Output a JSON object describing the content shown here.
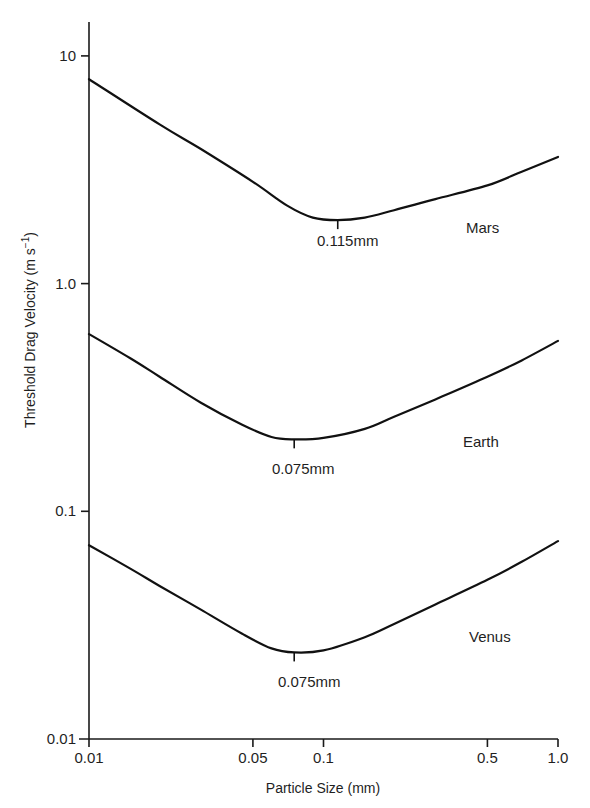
{
  "chart_data": {
    "type": "line",
    "title": "",
    "xlabel": "Particle Size (mm)",
    "ylabel": "Threshold Drag Velocity (m s⁻¹)",
    "ylabel_parts": {
      "main": "Threshold Drag Velocity (m s",
      "sup": "−1",
      "close": ")"
    },
    "xscale": "log",
    "yscale": "log",
    "xlim": [
      0.01,
      1.0
    ],
    "ylim": [
      0.01,
      10
    ],
    "grid": false,
    "legend": "inline labels at right of each curve",
    "x_ticks": [
      {
        "value": 0.01,
        "label": "0.01"
      },
      {
        "value": 0.05,
        "label": "0.05"
      },
      {
        "value": 0.1,
        "label": "0.1"
      },
      {
        "value": 0.5,
        "label": "0.5"
      },
      {
        "value": 1.0,
        "label": "1.0"
      }
    ],
    "y_ticks": [
      {
        "value": 10,
        "label": "10"
      },
      {
        "value": 1.0,
        "label": "1.0"
      },
      {
        "value": 0.1,
        "label": "0.1"
      },
      {
        "value": 0.01,
        "label": "0.01"
      }
    ],
    "series": [
      {
        "name": "Mars",
        "minimum": {
          "x": 0.115,
          "y": 1.9,
          "label": "0.115mm"
        },
        "points": [
          {
            "x": 0.01,
            "y": 7.9
          },
          {
            "x": 0.02,
            "y": 5.0
          },
          {
            "x": 0.03,
            "y": 3.9
          },
          {
            "x": 0.05,
            "y": 2.8
          },
          {
            "x": 0.07,
            "y": 2.2
          },
          {
            "x": 0.09,
            "y": 1.95
          },
          {
            "x": 0.115,
            "y": 1.9
          },
          {
            "x": 0.15,
            "y": 1.95
          },
          {
            "x": 0.2,
            "y": 2.1
          },
          {
            "x": 0.3,
            "y": 2.35
          },
          {
            "x": 0.5,
            "y": 2.7
          },
          {
            "x": 0.7,
            "y": 3.1
          },
          {
            "x": 1.0,
            "y": 3.6
          }
        ]
      },
      {
        "name": "Earth",
        "minimum": {
          "x": 0.075,
          "y": 0.207,
          "label": "0.075mm"
        },
        "points": [
          {
            "x": 0.01,
            "y": 0.6
          },
          {
            "x": 0.015,
            "y": 0.47
          },
          {
            "x": 0.02,
            "y": 0.39
          },
          {
            "x": 0.03,
            "y": 0.3
          },
          {
            "x": 0.045,
            "y": 0.24
          },
          {
            "x": 0.06,
            "y": 0.212
          },
          {
            "x": 0.075,
            "y": 0.207
          },
          {
            "x": 0.1,
            "y": 0.21
          },
          {
            "x": 0.15,
            "y": 0.23
          },
          {
            "x": 0.2,
            "y": 0.26
          },
          {
            "x": 0.3,
            "y": 0.31
          },
          {
            "x": 0.5,
            "y": 0.39
          },
          {
            "x": 0.7,
            "y": 0.46
          },
          {
            "x": 1.0,
            "y": 0.56
          }
        ]
      },
      {
        "name": "Venus",
        "minimum": {
          "x": 0.075,
          "y": 0.024,
          "label": "0.075mm"
        },
        "points": [
          {
            "x": 0.01,
            "y": 0.071
          },
          {
            "x": 0.015,
            "y": 0.056
          },
          {
            "x": 0.02,
            "y": 0.047
          },
          {
            "x": 0.03,
            "y": 0.037
          },
          {
            "x": 0.045,
            "y": 0.029
          },
          {
            "x": 0.06,
            "y": 0.025
          },
          {
            "x": 0.075,
            "y": 0.024
          },
          {
            "x": 0.1,
            "y": 0.0245
          },
          {
            "x": 0.15,
            "y": 0.028
          },
          {
            "x": 0.2,
            "y": 0.032
          },
          {
            "x": 0.3,
            "y": 0.039
          },
          {
            "x": 0.5,
            "y": 0.05
          },
          {
            "x": 0.7,
            "y": 0.06
          },
          {
            "x": 1.0,
            "y": 0.074
          }
        ]
      }
    ]
  },
  "layout_px": {
    "x_axis": {
      "px_at_min": 89,
      "px_per_decade": 234.5,
      "log_min": -2
    },
    "y_axis": {
      "px_at_min": 739,
      "px_per_decade": 227.7,
      "log_min": -2
    },
    "y_axis_top": 22,
    "x_axis_right": 558,
    "series_label_pos": {
      "Mars": {
        "x": 466,
        "y": 233
      },
      "Earth": {
        "x": 463,
        "y": 447
      },
      "Venus": {
        "x": 469,
        "y": 642
      }
    },
    "min_label_pos": {
      "Mars": {
        "x": 317,
        "y": 246
      },
      "Earth": {
        "x": 272,
        "y": 474
      },
      "Venus": {
        "x": 278,
        "y": 687
      }
    }
  }
}
